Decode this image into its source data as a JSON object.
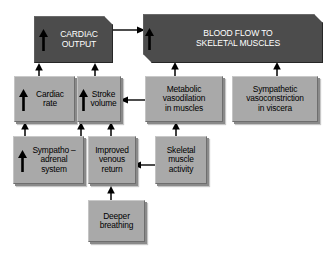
{
  "diagram": {
    "background_color": "#ffffff",
    "box_fill_light": "#a9a9a9",
    "box_fill_dark": "#4c4c4c",
    "arrow_color": "#000000"
  },
  "nodes": {
    "cardiac_output": {
      "label": "CARDIAC\nOUTPUT",
      "style": "dark",
      "arrow_inside": true
    },
    "blood_flow": {
      "label": "BLOOD FLOW TO\nSKELETAL MUSCLES",
      "style": "dark",
      "arrow_inside": true
    },
    "cardiac_rate": {
      "label": "Cardiac\nrate",
      "style": "light",
      "arrow_inside": true
    },
    "stroke_volume": {
      "label": "Stroke\nvolume",
      "style": "light",
      "arrow_inside": true
    },
    "metabolic_vasodilation": {
      "label": "Metabolic\nvasodilation\nin muscles",
      "style": "light",
      "arrow_inside": false
    },
    "sympathetic_vasoconstriction": {
      "label": "Sympathetic\nvasoconstriction\nin viscera",
      "style": "light",
      "arrow_inside": false
    },
    "sympatho_adrenal": {
      "label": "Sympatho –\nadrenal\nsystem",
      "style": "light",
      "arrow_inside": true
    },
    "improved_venous_return": {
      "label": "Improved\nvenous\nreturn",
      "style": "light",
      "arrow_inside": false
    },
    "skeletal_muscle_activity": {
      "label": "Skeletal\nmuscle\nactivity",
      "style": "light",
      "arrow_inside": false
    },
    "deeper_breathing": {
      "label": "Deeper\nbreathing",
      "style": "light",
      "arrow_inside": false
    }
  },
  "connections": [
    {
      "from": "cardiac_output",
      "to": "blood_flow",
      "direction": "right"
    },
    {
      "from": "cardiac_rate",
      "to": "cardiac_output",
      "direction": "up"
    },
    {
      "from": "stroke_volume",
      "to": "cardiac_output",
      "direction": "up"
    },
    {
      "from": "metabolic_vasodilation",
      "to": "blood_flow",
      "direction": "up"
    },
    {
      "from": "sympathetic_vasoconstriction",
      "to": "blood_flow",
      "direction": "up"
    },
    {
      "from": "metabolic_vasodilation",
      "to": "stroke_volume",
      "direction": "left"
    },
    {
      "from": "sympatho_adrenal",
      "to": "cardiac_rate",
      "direction": "up"
    },
    {
      "from": "sympatho_adrenal",
      "to": "stroke_volume",
      "direction": "up"
    },
    {
      "from": "improved_venous_return",
      "to": "stroke_volume",
      "direction": "up"
    },
    {
      "from": "skeletal_muscle_activity",
      "to": "metabolic_vasodilation",
      "direction": "up"
    },
    {
      "from": "skeletal_muscle_activity",
      "to": "improved_venous_return",
      "direction": "left"
    },
    {
      "from": "deeper_breathing",
      "to": "improved_venous_return",
      "direction": "up"
    }
  ]
}
